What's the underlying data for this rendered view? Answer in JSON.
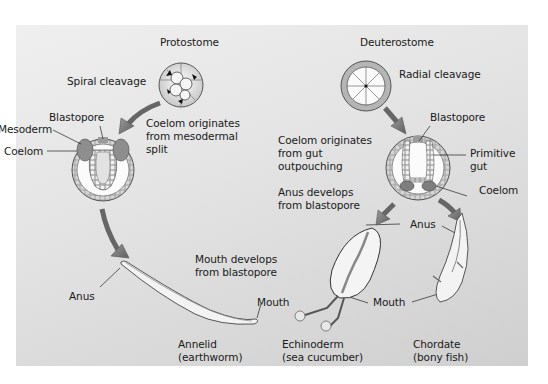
{
  "colors": {
    "panel": "#dcdcdc",
    "text": "#1a1a1a",
    "arrow": "#7a7a7a",
    "cell_dark": "#8a8a8a",
    "cell_light": "#e8e8e8"
  },
  "protostome": {
    "title": "Protostome",
    "cleavage": "Spiral cleavage",
    "blastopore": "Blastopore",
    "mesoderm": "Mesoderm",
    "coelom": "Coelom",
    "coelom_origin": "Coelom originates\nfrom mesodermal\nsplit",
    "mouth_origin": "Mouth develops\nfrom blastopore",
    "anus": "Anus",
    "mouth": "Mouth",
    "organism": "Annelid\n(earthworm)"
  },
  "deuterostome": {
    "title": "Deuterostome",
    "cleavage": "Radial cleavage",
    "blastopore": "Blastopore",
    "primitive_gut": "Primitive\ngut",
    "coelom": "Coelom",
    "coelom_origin": "Coelom originates\nfrom gut\noutpouching",
    "anus_origin": "Anus develops\nfrom blastopore",
    "anus": "Anus",
    "mouth": "Mouth",
    "organism_1": "Echinoderm\n(sea cucumber)",
    "organism_2": "Chordate\n(bony fish)"
  }
}
